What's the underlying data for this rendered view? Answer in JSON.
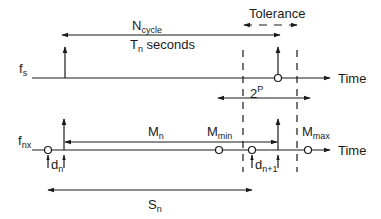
{
  "diagram": {
    "top_signal": {
      "label_main": "f",
      "label_sub": "s",
      "axis_label": "Time"
    },
    "bottom_signal": {
      "label_main": "f",
      "label_sub": "nx",
      "axis_label": "Time"
    },
    "annotations": {
      "ncycle_main": "N",
      "ncycle_sub": "cycle",
      "tn_main": "T",
      "tn_sub": "n",
      "tn_suffix": " seconds",
      "tolerance": "Tolerance",
      "two_p_main": "2",
      "two_p_sup": "P",
      "mn_main": "M",
      "mn_sub": "n",
      "mmin_main": "M",
      "mmin_sub": "min",
      "mmax_main": "M",
      "mmax_sub": "max",
      "dn_main": "d",
      "dn_sub": "n",
      "dn1_main": "d",
      "dn1_sub": "n+1",
      "sn_main": "S",
      "sn_sub": "n"
    },
    "colors": {
      "line": "#1a1a1a",
      "background": "#ffffff"
    }
  }
}
